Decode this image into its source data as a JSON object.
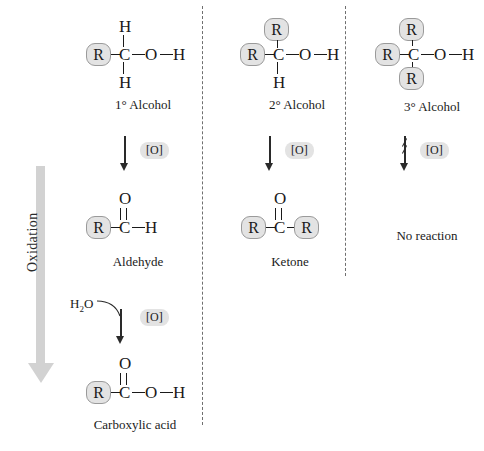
{
  "diagram": {
    "process_label": "Oxidation",
    "reagent_label": "[O]",
    "water_label": "H2O",
    "colors": {
      "rgroup_fill": "#e3e3e3",
      "rgroup_stroke": "#9a9a9a",
      "bond": "#1a1a1a",
      "divider": "#6f6f6f",
      "oxidation_arrow": "#d2d2d2",
      "badge_fill": "#e3e3e3",
      "background": "#ffffff"
    }
  },
  "columns": [
    {
      "id": "primary",
      "rows": [
        {
          "kind": "structure",
          "name": "primary-alcohol",
          "caption": "1° Alcohol",
          "atoms": {
            "top": "H",
            "left": "R",
            "center": "C",
            "bottom": "H",
            "right1": "O",
            "right2": "H"
          }
        },
        {
          "kind": "arrow",
          "name": "oxidation-step-1",
          "reagent": "[O]",
          "crossed": false,
          "byproduct": null
        },
        {
          "kind": "structure",
          "name": "aldehyde",
          "caption": "Aldehyde",
          "atoms": {
            "top": "O",
            "left": "R",
            "center": "C",
            "right1": "H"
          }
        },
        {
          "kind": "arrow",
          "name": "oxidation-step-2",
          "reagent": "[O]",
          "crossed": false,
          "byproduct": "H2O"
        },
        {
          "kind": "structure",
          "name": "carboxylic-acid",
          "caption": "Carboxylic acid",
          "atoms": {
            "top": "O",
            "left": "R",
            "center": "C",
            "right1": "O",
            "right2": "H"
          }
        }
      ]
    },
    {
      "id": "secondary",
      "rows": [
        {
          "kind": "structure",
          "name": "secondary-alcohol",
          "caption": "2° Alcohol",
          "atoms": {
            "top": "R",
            "left": "R",
            "center": "C",
            "bottom": "H",
            "right1": "O",
            "right2": "H"
          }
        },
        {
          "kind": "arrow",
          "name": "oxidation-step-1",
          "reagent": "[O]",
          "crossed": false,
          "byproduct": null
        },
        {
          "kind": "structure",
          "name": "ketone",
          "caption": "Ketone",
          "atoms": {
            "top": "O",
            "left": "R",
            "center": "C",
            "right1": "R"
          }
        }
      ]
    },
    {
      "id": "tertiary",
      "rows": [
        {
          "kind": "structure",
          "name": "tertiary-alcohol",
          "caption": "3° Alcohol",
          "atoms": {
            "top": "R",
            "left": "R",
            "center": "C",
            "bottom": "R",
            "right1": "O",
            "right2": "H"
          }
        },
        {
          "kind": "arrow",
          "name": "no-oxidation",
          "reagent": "[O]",
          "crossed": true,
          "byproduct": null
        },
        {
          "kind": "text",
          "name": "no-reaction",
          "caption": "No reaction"
        }
      ]
    }
  ],
  "labels": {
    "primary_alcohol": "1° Alcohol",
    "secondary_alcohol": "2° Alcohol",
    "tertiary_alcohol": "3° Alcohol",
    "aldehyde": "Aldehyde",
    "ketone": "Ketone",
    "carboxylic_acid": "Carboxylic acid",
    "no_reaction": "No reaction",
    "oxidation": "Oxidation",
    "reagent": "[O]"
  },
  "glyphs": {
    "R": "R",
    "C": "C",
    "H": "H",
    "O": "O",
    "H2O_main": "H",
    "H2O_sub": "2",
    "H2O_tail": "O"
  }
}
